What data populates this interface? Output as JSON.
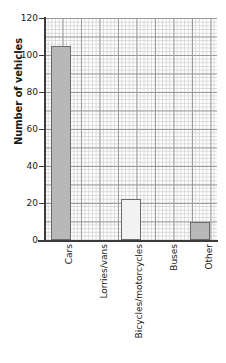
{
  "chart_data": {
    "type": "bar",
    "title": "",
    "xlabel": "",
    "ylabel": "Number of vehicles",
    "categories": [
      "Cars",
      "Lorries/vans",
      "Bicycles/motorcycles",
      "Buses",
      "Other"
    ],
    "values": [
      105,
      0,
      22,
      0,
      10
    ],
    "ylim": [
      0,
      120
    ],
    "y_ticks": [
      0,
      20,
      40,
      60,
      80,
      100,
      120
    ],
    "y_tick_labels": [
      "0",
      "20",
      "40",
      "60",
      "80",
      "100",
      "120"
    ],
    "grid": true,
    "grid_style": "graph-paper",
    "legend": "none",
    "bar_colors": [
      "#b8b8b8",
      "none",
      "#f2f2f2",
      "none",
      "#b8b8b8"
    ],
    "bar_edge_color": "#6b6b6b"
  },
  "axes": {
    "y_title": "Number of vehicles",
    "tick_0": "0",
    "tick_20": "20",
    "tick_40": "40",
    "tick_60": "60",
    "tick_80": "80",
    "tick_100": "100",
    "tick_120": "120"
  },
  "categories": {
    "c0": "Cars",
    "c1": "Lorries/vans",
    "c2": "Bicycles/motorcycles",
    "c3": "Buses",
    "c4": "Other"
  }
}
